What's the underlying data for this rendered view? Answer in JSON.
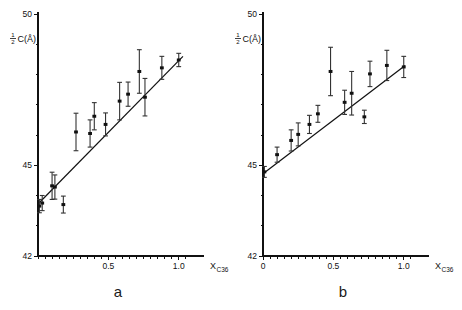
{
  "figure": {
    "background_color": "#ffffff",
    "ink_color": "#111111",
    "panel_count": 2
  },
  "chart_data": [
    {
      "type": "scatter",
      "panel_label": "a",
      "title": "",
      "subtitle": "",
      "xlabel": "X",
      "xlabel_subscript": "C36",
      "ylabel_numerator": "1",
      "ylabel_denominator": "2",
      "ylabel_rest": "C(Å)",
      "ylabel_full": "½C(Å)",
      "xlim": [
        0,
        1.08
      ],
      "ylim": [
        42,
        50
      ],
      "xticks": [
        0.5,
        1.0
      ],
      "xtick_labels": [
        "0.5",
        "1.0"
      ],
      "xminorticks": [
        0.0,
        0.05,
        0.1,
        0.15,
        0.2,
        0.25,
        0.3,
        0.35,
        0.4,
        0.45,
        0.55,
        0.6,
        0.65,
        0.7,
        0.75,
        0.8,
        0.85,
        0.9,
        0.95,
        1.05
      ],
      "yticks": [
        42,
        45,
        50
      ],
      "ytick_labels": [
        "42",
        "45",
        "50"
      ],
      "yminorticks": [
        43,
        44,
        46,
        47,
        48,
        49
      ],
      "grid": false,
      "legend": "none",
      "errorbar_style": "vertical-with-caps",
      "marker": "filled-square",
      "fit_line": {
        "type": "linear",
        "x_start": 0.0,
        "y_start": 43.72,
        "x_end": 1.03,
        "y_end": 48.6
      },
      "points": [
        {
          "x": 0.01,
          "y": 43.65,
          "yerr": 0.22
        },
        {
          "x": 0.03,
          "y": 43.75,
          "yerr": 0.25
        },
        {
          "x": 0.1,
          "y": 44.32,
          "yerr": 0.45
        },
        {
          "x": 0.12,
          "y": 44.28,
          "yerr": 0.4
        },
        {
          "x": 0.18,
          "y": 43.7,
          "yerr": 0.28
        },
        {
          "x": 0.27,
          "y": 46.1,
          "yerr": 0.62
        },
        {
          "x": 0.37,
          "y": 46.05,
          "yerr": 0.45
        },
        {
          "x": 0.4,
          "y": 46.62,
          "yerr": 0.45
        },
        {
          "x": 0.48,
          "y": 46.35,
          "yerr": 0.38
        },
        {
          "x": 0.58,
          "y": 47.12,
          "yerr": 0.62
        },
        {
          "x": 0.64,
          "y": 47.35,
          "yerr": 0.4
        },
        {
          "x": 0.72,
          "y": 48.1,
          "yerr": 0.72
        },
        {
          "x": 0.76,
          "y": 47.25,
          "yerr": 0.62
        },
        {
          "x": 0.88,
          "y": 48.22,
          "yerr": 0.38
        },
        {
          "x": 1.0,
          "y": 48.48,
          "yerr": 0.22
        }
      ]
    },
    {
      "type": "scatter",
      "panel_label": "b",
      "title": "",
      "subtitle": "",
      "xlabel": "X",
      "xlabel_subscript": "C36",
      "ylabel_numerator": "1",
      "ylabel_denominator": "2",
      "ylabel_rest": "C(Å)",
      "ylabel_full": "½C(Å)",
      "xlim": [
        0,
        1.08
      ],
      "ylim": [
        42,
        50
      ],
      "xticks": [
        0.0,
        0.5,
        1.0
      ],
      "xtick_labels": [
        "0",
        "0.5",
        "1.0"
      ],
      "xminorticks": [
        0.05,
        0.1,
        0.15,
        0.2,
        0.25,
        0.3,
        0.35,
        0.4,
        0.45,
        0.55,
        0.6,
        0.65,
        0.7,
        0.75,
        0.8,
        0.85,
        0.9,
        0.95,
        1.05
      ],
      "yticks": [
        42,
        45,
        50
      ],
      "ytick_labels": [
        "42",
        "45",
        "50"
      ],
      "yminorticks": [
        43,
        44,
        46,
        47,
        48,
        49
      ],
      "grid": false,
      "legend": "none",
      "errorbar_style": "vertical-with-caps",
      "marker": "filled-square",
      "fit_line": {
        "type": "linear",
        "x_start": 0.0,
        "y_start": 44.72,
        "x_end": 1.01,
        "y_end": 48.3
      },
      "points": [
        {
          "x": 0.01,
          "y": 44.78,
          "yerr": 0.18
        },
        {
          "x": 0.1,
          "y": 45.35,
          "yerr": 0.25
        },
        {
          "x": 0.2,
          "y": 45.82,
          "yerr": 0.35
        },
        {
          "x": 0.25,
          "y": 46.02,
          "yerr": 0.38
        },
        {
          "x": 0.33,
          "y": 46.35,
          "yerr": 0.3
        },
        {
          "x": 0.39,
          "y": 46.7,
          "yerr": 0.28
        },
        {
          "x": 0.48,
          "y": 48.1,
          "yerr": 0.8
        },
        {
          "x": 0.58,
          "y": 47.08,
          "yerr": 0.4
        },
        {
          "x": 0.63,
          "y": 47.38,
          "yerr": 0.72
        },
        {
          "x": 0.72,
          "y": 46.6,
          "yerr": 0.22
        },
        {
          "x": 0.76,
          "y": 48.02,
          "yerr": 0.42
        },
        {
          "x": 0.88,
          "y": 48.3,
          "yerr": 0.5
        },
        {
          "x": 1.0,
          "y": 48.25,
          "yerr": 0.35
        }
      ]
    }
  ]
}
